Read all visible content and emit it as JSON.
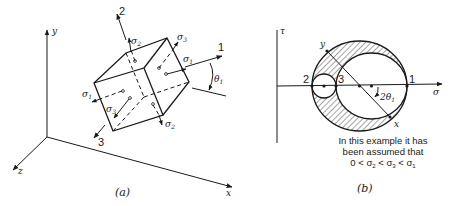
{
  "panel_a": {
    "caption": "(a)",
    "global_axes": {
      "y": "y",
      "z": "z",
      "x": "x"
    },
    "principal_axes": {
      "one": "1",
      "two": "2",
      "three": "3"
    },
    "stress_labels": {
      "sigma": "σ",
      "sub1": "1",
      "sub2": "2",
      "sub3": "3"
    },
    "angle": {
      "symbol": "θ",
      "sub": "1"
    }
  },
  "panel_b": {
    "caption": "(b)",
    "axes": {
      "tau": "τ",
      "sigma": "σ"
    },
    "points": {
      "p2": "2",
      "p3": "3",
      "p1": "1",
      "y": "y",
      "x": "x"
    },
    "angle": {
      "prefix": "2θ",
      "sub": "1"
    },
    "note": {
      "line1": "In this example it has",
      "line2": "been assumed that",
      "line3_prefix": "0 < σ",
      "line3_sub2": "2",
      "line3_mid1": " < σ",
      "line3_sub3": "3",
      "line3_mid2": " < σ",
      "line3_sub1": "1"
    }
  },
  "colors": {
    "ink": "#1a1a1a",
    "background": "#ffffff"
  }
}
